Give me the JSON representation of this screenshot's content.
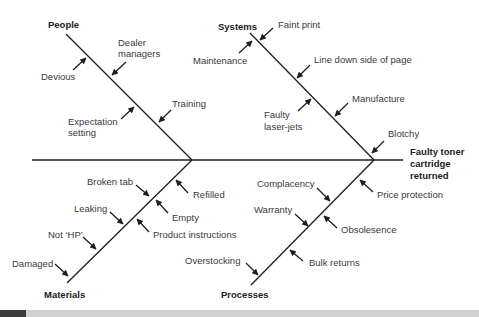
{
  "diagram": {
    "type": "fishbone",
    "effect": [
      "Faulty toner",
      "cartridge",
      "returned"
    ],
    "categories": {
      "people": {
        "label": "People",
        "causes": [
          {
            "lines": [
              "Devious"
            ]
          },
          {
            "lines": [
              "Dealer",
              "managers"
            ]
          },
          {
            "lines": [
              "Expectation",
              "setting"
            ]
          },
          {
            "lines": [
              "Training"
            ]
          }
        ]
      },
      "systems": {
        "label": "Systems",
        "causes": [
          {
            "lines": [
              "Faint print"
            ]
          },
          {
            "lines": [
              "Maintenance"
            ]
          },
          {
            "lines": [
              "Line down side of page"
            ]
          },
          {
            "lines": [
              "Faulty",
              "laser-jets"
            ]
          },
          {
            "lines": [
              "Manufacture"
            ]
          },
          {
            "lines": [
              "Blotchy"
            ]
          }
        ]
      },
      "materials": {
        "label": "Materials",
        "causes": [
          {
            "lines": [
              "Broken tab"
            ]
          },
          {
            "lines": [
              "Refilled"
            ]
          },
          {
            "lines": [
              "Leaking"
            ]
          },
          {
            "lines": [
              "Empty"
            ]
          },
          {
            "lines": [
              "Not ‘HP’"
            ]
          },
          {
            "lines": [
              "Product instructions"
            ]
          },
          {
            "lines": [
              "Damaged"
            ]
          }
        ]
      },
      "processes": {
        "label": "Processes",
        "causes": [
          {
            "lines": [
              "Complacency"
            ]
          },
          {
            "lines": [
              "Price protection"
            ]
          },
          {
            "lines": [
              "Warranty"
            ]
          },
          {
            "lines": [
              "Obsolesence"
            ]
          },
          {
            "lines": [
              "Overstocking"
            ]
          },
          {
            "lines": [
              "Bulk returns"
            ]
          }
        ]
      }
    }
  }
}
